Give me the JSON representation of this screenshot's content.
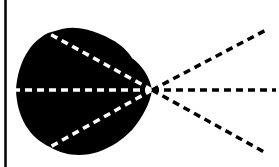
{
  "diagram": {
    "canvas": {
      "width": 279,
      "height": 167,
      "background": "#ffffff"
    },
    "left_border": {
      "x": 5.5,
      "y1": 0,
      "y2": 167,
      "color": "#000000",
      "width": 2.5
    },
    "blob": {
      "fill": "#000000",
      "path": "M152,90 C150,78 143,66 132,58 C126,48 115,40 100,34 C88,29 75,26 62,29 L48,33 C30,42 18,62 16,90 C17,118 30,138 50,147 C65,156 82,157 98,152 C112,147 122,140 132,130 C142,118 150,104 152,90 Z"
    },
    "apex": {
      "x": 152,
      "y": 90
    },
    "inner_rays": {
      "color": "#ffffff",
      "dash": "7 5",
      "width": 3.5,
      "ends": [
        {
          "x": 48,
          "y": 33
        },
        {
          "x": 16,
          "y": 90
        },
        {
          "x": 50,
          "y": 147
        }
      ]
    },
    "outer_rays": {
      "color": "#000000",
      "dash": "7 5",
      "width": 3.5,
      "ends": [
        {
          "x": 266,
          "y": 30
        },
        {
          "x": 276,
          "y": 90
        },
        {
          "x": 266,
          "y": 153
        }
      ]
    }
  }
}
